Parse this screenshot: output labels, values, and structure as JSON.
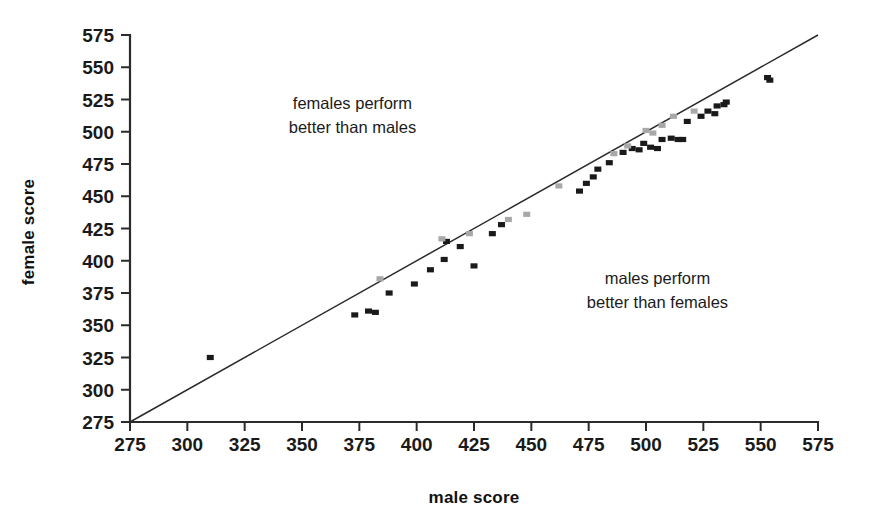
{
  "chart_data": {
    "type": "scatter",
    "title": "",
    "xlabel": "male score",
    "ylabel": "female score",
    "xlim": [
      275,
      575
    ],
    "ylim": [
      275,
      575
    ],
    "xticks": [
      275,
      300,
      325,
      350,
      375,
      400,
      425,
      450,
      475,
      500,
      525,
      550,
      575
    ],
    "yticks": [
      275,
      300,
      325,
      350,
      375,
      400,
      425,
      450,
      475,
      500,
      525,
      550,
      575
    ],
    "grid": false,
    "legend": "none",
    "reference_line": {
      "name": "identity-line",
      "label": "y = x",
      "from": [
        275,
        275
      ],
      "to": [
        575,
        575
      ],
      "color": "#2a2a2a"
    },
    "annotations": [
      {
        "name": "females-better-annotation",
        "lines": [
          "females perform",
          "better than males"
        ],
        "at": [
          372,
          518
        ]
      },
      {
        "name": "males-better-annotation",
        "lines": [
          "males perform",
          "better than females"
        ],
        "at": [
          505,
          382
        ]
      }
    ],
    "series": [
      {
        "name": "dark-markers",
        "color": "#1a1a1a",
        "points": [
          [
            310,
            325
          ],
          [
            373,
            358
          ],
          [
            379,
            361
          ],
          [
            382,
            360
          ],
          [
            388,
            375
          ],
          [
            399,
            382
          ],
          [
            406,
            393
          ],
          [
            412,
            401
          ],
          [
            413,
            415
          ],
          [
            419,
            411
          ],
          [
            425,
            396
          ],
          [
            433,
            421
          ],
          [
            437,
            428
          ],
          [
            471,
            454
          ],
          [
            474,
            460
          ],
          [
            477,
            465
          ],
          [
            479,
            471
          ],
          [
            484,
            476
          ],
          [
            490,
            484
          ],
          [
            494,
            487
          ],
          [
            497,
            486
          ],
          [
            499,
            491
          ],
          [
            502,
            488
          ],
          [
            505,
            487
          ],
          [
            507,
            494
          ],
          [
            511,
            495
          ],
          [
            514,
            494
          ],
          [
            516,
            494
          ],
          [
            518,
            508
          ],
          [
            524,
            512
          ],
          [
            527,
            516
          ],
          [
            530,
            514
          ],
          [
            531,
            520
          ],
          [
            534,
            521
          ],
          [
            535,
            523
          ],
          [
            553,
            542
          ],
          [
            554,
            540
          ]
        ]
      },
      {
        "name": "light-gray-markers",
        "color": "#a8a8a8",
        "points": [
          [
            384,
            386
          ],
          [
            411,
            417
          ],
          [
            423,
            421
          ],
          [
            440,
            432
          ],
          [
            448,
            436
          ],
          [
            462,
            458
          ],
          [
            486,
            483
          ],
          [
            492,
            489
          ],
          [
            500,
            501
          ],
          [
            503,
            499
          ],
          [
            507,
            505
          ],
          [
            512,
            512
          ],
          [
            521,
            516
          ]
        ]
      }
    ]
  }
}
